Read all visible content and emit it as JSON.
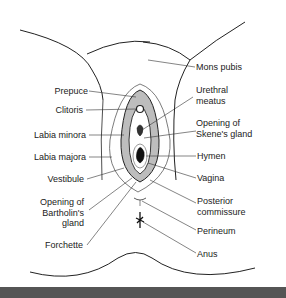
{
  "figure": {
    "labels_left": [
      {
        "id": "prepuce",
        "text": "Prepuce"
      },
      {
        "id": "clitoris",
        "text": "Clitoris"
      },
      {
        "id": "labia-minora",
        "text": "Labia minora"
      },
      {
        "id": "labia-majora",
        "text": "Labia majora"
      },
      {
        "id": "vestibule",
        "text": "Vestibule"
      },
      {
        "id": "bartholin",
        "line1": "Opening of",
        "line2": "Bartholin's",
        "line3": "gland"
      },
      {
        "id": "forchette",
        "text": "Forchette"
      }
    ],
    "labels_right": [
      {
        "id": "mons-pubis",
        "text": "Mons pubis"
      },
      {
        "id": "urethral-meatus",
        "line1": "Urethral",
        "line2": "meatus"
      },
      {
        "id": "skene",
        "line1": "Opening of",
        "line2": "Skene's gland"
      },
      {
        "id": "hymen",
        "text": "Hymen"
      },
      {
        "id": "vagina",
        "text": "Vagina"
      },
      {
        "id": "posterior-commissure",
        "line1": "Posterior",
        "line2": "commissure"
      },
      {
        "id": "perineum",
        "text": "Perineum"
      },
      {
        "id": "anus",
        "text": "Anus"
      }
    ]
  }
}
